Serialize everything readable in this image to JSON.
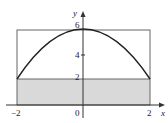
{
  "diagram": {
    "type": "function-plot",
    "curve": "y = 6 - x^2",
    "x_range": [
      -2,
      2
    ],
    "axes": {
      "x_label": "x",
      "y_label": "y"
    },
    "x_ticks": [
      {
        "value": -2,
        "label": "−2"
      },
      {
        "value": 0,
        "label": "0"
      },
      {
        "value": 2,
        "label": "2"
      }
    ],
    "y_ticks": [
      {
        "value": 2,
        "label": "2"
      },
      {
        "value": 4,
        "label": "4"
      },
      {
        "value": 6,
        "label": "6"
      }
    ],
    "outer_rectangle": {
      "x_from": -2,
      "x_to": 2,
      "y_from": 0,
      "y_to": 6
    },
    "shaded_rectangle": {
      "x_from": -2,
      "x_to": 2,
      "y_from": 0,
      "y_to": 2
    },
    "colors": {
      "axis": "#333333",
      "curve": "#222222",
      "rectangle": "#666666",
      "shade": "#d9d9d9"
    }
  }
}
